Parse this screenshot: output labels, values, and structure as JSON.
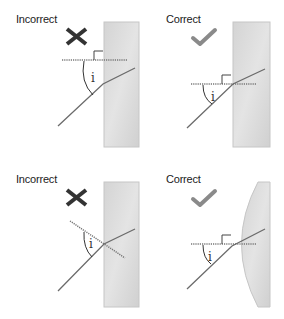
{
  "panels": [
    {
      "id": "top-left",
      "label": "Incorrect",
      "status": "incorrect",
      "symbol": "cross-icon",
      "angle_label": "i",
      "surface": "flat-block",
      "normal": "horizontal-wrong-position"
    },
    {
      "id": "top-right",
      "label": "Correct",
      "status": "correct",
      "symbol": "check-icon",
      "angle_label": "i",
      "surface": "flat-block",
      "normal": "horizontal-at-incidence-point"
    },
    {
      "id": "bottom-left",
      "label": "Incorrect",
      "status": "incorrect",
      "symbol": "cross-icon",
      "angle_label": "i",
      "surface": "flat-block",
      "normal": "tilted-not-perpendicular"
    },
    {
      "id": "bottom-right",
      "label": "Correct",
      "status": "correct",
      "symbol": "check-icon",
      "angle_label": "i",
      "surface": "curved-lens",
      "normal": "horizontal-at-incidence-point"
    }
  ],
  "colors": {
    "cross": "#333333",
    "check": "#8a8a8a",
    "block_fill": "#d6d6d6",
    "block_edge": "#c4c4c4",
    "ray": "#6b6b6b",
    "normal": "#777777",
    "text": "#222222"
  }
}
